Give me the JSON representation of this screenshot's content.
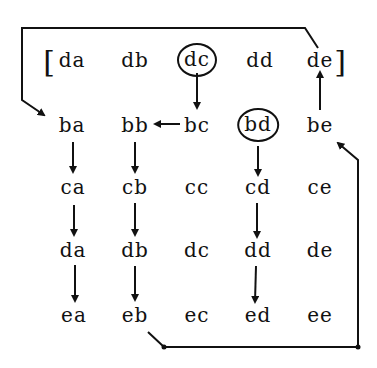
{
  "diagram": {
    "stroke_color": "#111111",
    "background": "#ffffff",
    "brackets": {
      "open": "[",
      "close": "]"
    },
    "rows": [
      {
        "id": "d-top",
        "cells": [
          "da",
          "db",
          "dc",
          "dd",
          "de"
        ],
        "circled": [
          2
        ]
      },
      {
        "id": "b",
        "cells": [
          "ba",
          "bb",
          "bc",
          "bd",
          "be"
        ],
        "circled": [
          3
        ]
      },
      {
        "id": "c",
        "cells": [
          "ca",
          "cb",
          "cc",
          "cd",
          "ce"
        ],
        "circled": []
      },
      {
        "id": "d",
        "cells": [
          "da",
          "db",
          "dc",
          "dd",
          "de"
        ],
        "circled": []
      },
      {
        "id": "e",
        "cells": [
          "ea",
          "eb",
          "ec",
          "ed",
          "ee"
        ],
        "circled": []
      }
    ],
    "arrows": [
      {
        "from": "dc (top)",
        "to": "bc",
        "direction": "down"
      },
      {
        "from": "bc",
        "to": "bb",
        "direction": "left"
      },
      {
        "from": "be",
        "to": "de (top)",
        "direction": "up"
      },
      {
        "from": "de (top)",
        "to": "ba",
        "route": "over top, down left side"
      },
      {
        "from": "ba",
        "to": "ca",
        "direction": "down"
      },
      {
        "from": "ca",
        "to": "da",
        "direction": "down"
      },
      {
        "from": "da",
        "to": "ea",
        "direction": "down"
      },
      {
        "from": "bb",
        "to": "cb",
        "direction": "down"
      },
      {
        "from": "cb",
        "to": "db",
        "direction": "down"
      },
      {
        "from": "db",
        "to": "eb",
        "direction": "down"
      },
      {
        "from": "bd",
        "to": "cd",
        "direction": "down"
      },
      {
        "from": "cd",
        "to": "dd",
        "direction": "down"
      },
      {
        "from": "dd",
        "to": "ed",
        "direction": "down"
      },
      {
        "from": "eb",
        "to": "be",
        "route": "along bottom, up right side"
      }
    ]
  }
}
